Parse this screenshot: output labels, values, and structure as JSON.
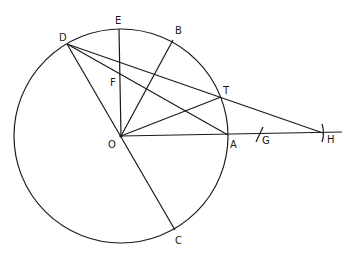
{
  "figure": {
    "type": "geometry-diagram",
    "circle": {
      "center": "O",
      "cx": 121,
      "cy": 136,
      "r": 107
    },
    "points": {
      "O": {
        "x": 121,
        "y": 136,
        "label": "O"
      },
      "A": {
        "x": 228,
        "y": 135,
        "label": "A"
      },
      "B": {
        "x": 173,
        "y": 40,
        "label": "B"
      },
      "C": {
        "x": 175,
        "y": 230,
        "label": "C"
      },
      "D": {
        "x": 67,
        "y": 44,
        "label": "D"
      },
      "E": {
        "x": 119,
        "y": 29,
        "label": "E"
      },
      "F": {
        "x": 119,
        "y": 74,
        "label": "F"
      },
      "T": {
        "x": 221,
        "y": 97,
        "label": "T"
      },
      "G": {
        "x": 259,
        "y": 134,
        "label": "G"
      },
      "H": {
        "x": 323,
        "y": 133,
        "label": "H"
      }
    },
    "segments": [
      [
        "E",
        "O"
      ],
      [
        "D",
        "C"
      ],
      [
        "O",
        "B"
      ],
      [
        "O",
        "T"
      ],
      [
        "D",
        "A"
      ],
      [
        "D",
        "H"
      ],
      [
        "O",
        "H-ext"
      ]
    ],
    "tick_marks": [
      "G",
      "H"
    ]
  }
}
